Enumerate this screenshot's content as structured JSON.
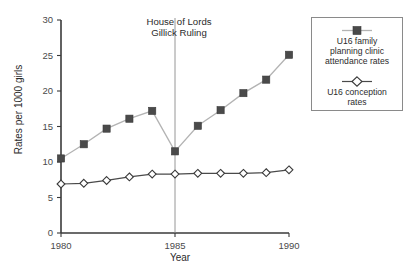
{
  "chart_data": {
    "type": "line",
    "title": "",
    "xlabel": "Year",
    "ylabel": "Rates per 1000 girls",
    "xlim": [
      1980,
      1990
    ],
    "ylim": [
      0,
      30
    ],
    "xticks": [
      1980,
      1985,
      1990
    ],
    "yticks": [
      0,
      5,
      10,
      15,
      20,
      25,
      30
    ],
    "grid": false,
    "legend_position": "right",
    "x": [
      1980,
      1981,
      1982,
      1983,
      1984,
      1985,
      1986,
      1987,
      1988,
      1989,
      1990
    ],
    "series": [
      {
        "name": "U16 family planning clinic attendance rates",
        "marker": "filled-square",
        "color": "#4a4a4a",
        "line_color": "#b3b3b3",
        "values": [
          10.5,
          12.5,
          14.7,
          16.1,
          17.2,
          11.5,
          15.1,
          17.3,
          19.7,
          21.6,
          25.1
        ]
      },
      {
        "name": "U16 conception rates",
        "marker": "open-diamond",
        "color": "#ffffff",
        "line_color": "#4a4a4a",
        "values": [
          6.9,
          7.0,
          7.4,
          7.9,
          8.3,
          8.3,
          8.4,
          8.4,
          8.4,
          8.5,
          8.9
        ]
      }
    ],
    "annotations": [
      {
        "name": "gillick-ruling",
        "text_line_1": "House of Lords",
        "text_line_2": "Gillick Ruling",
        "x": 1985,
        "type": "vertical-line-with-label"
      }
    ]
  },
  "axes": {
    "ylabel": "Rates per 1000 girls",
    "xlabel": "Year",
    "ytick_labels": [
      "0",
      "5",
      "10",
      "15",
      "20",
      "25",
      "30"
    ],
    "xtick_labels": [
      "1980",
      "1985",
      "1990"
    ]
  },
  "annotation": {
    "line_1": "House of Lords",
    "line_2": "Gillick Ruling"
  },
  "legend": {
    "entries": [
      {
        "symbol": "filled-square-marker",
        "line_1": "U16 family",
        "line_2": "planning clinic",
        "line_3": "attendance rates"
      },
      {
        "symbol": "open-diamond-marker",
        "line_1": "U16 conception",
        "line_2": "rates"
      }
    ]
  },
  "colors": {
    "axis": "#3a3a3a",
    "attendance_marker": "#4a4a4a",
    "attendance_line": "#b3b3b3",
    "conception_line": "#4a4a4a",
    "conception_marker_fill": "#ffffff",
    "event_line": "#8a8a8a"
  }
}
